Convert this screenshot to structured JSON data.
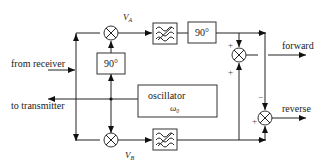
{
  "diagram": {
    "title": "",
    "inputs": {
      "from_receiver": "from receiver",
      "to_transmitter": "to transmitter"
    },
    "outputs": {
      "forward": "forward",
      "reverse": "reverse"
    },
    "blocks": {
      "phase_shift_top": "90°",
      "phase_shift_left": "90°",
      "oscillator_label": "oscillator",
      "oscillator_freq": "ω₀"
    },
    "signals": {
      "va": "V",
      "va_sub": "A",
      "vb": "V",
      "vb_sub": "B"
    },
    "signs": {
      "forward_top": "+",
      "forward_bottom": "+",
      "reverse_top": "−",
      "reverse_left": "+"
    }
  }
}
